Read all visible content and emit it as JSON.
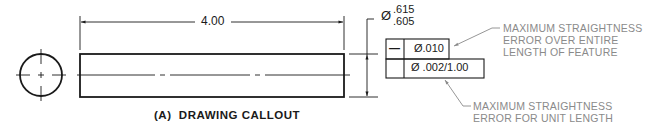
{
  "drawing": {
    "length_dimension": "4.00",
    "diameter_symbol": "Ø",
    "diameter_upper": ".615",
    "diameter_lower": ".605"
  },
  "feature_control_frame": {
    "symbol": "—",
    "symbol_name": "straightness",
    "row1_tolerance": "Ø.010",
    "row2_tolerance": "Ø .002/1.00"
  },
  "notes": {
    "overall": [
      "MAXIMUM STRAIGHTNESS",
      "ERROR OVER ENTIRE",
      "LENGTH OF FEATURE"
    ],
    "unit": [
      "MAXIMUM STRAIGHTNESS",
      "ERROR FOR UNIT LENGTH"
    ]
  },
  "caption": "(A)  DRAWING CALLOUT",
  "colors": {
    "line": "#1a1a1a",
    "note_text": "#8a8a8a",
    "leader": "#8a8a8a"
  }
}
